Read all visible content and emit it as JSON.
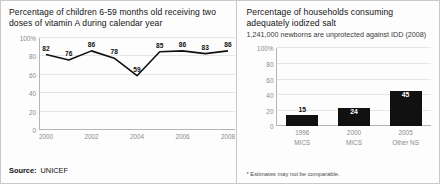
{
  "left": {
    "title": "Percentage of children 6-59 months old receiving two doses of vitamin A during calendar year",
    "source_label": "Source:",
    "source_value": "UNICEF",
    "chart_data": {
      "type": "line",
      "title": "Percentage of children 6-59 months old receiving two doses of vitamin A during calendar year",
      "xlabel": "",
      "ylabel": "",
      "ylim": [
        0,
        100
      ],
      "yticks": [
        "0",
        "20",
        "40",
        "60",
        "80",
        "100%"
      ],
      "ytick_values": [
        0,
        20,
        40,
        60,
        80,
        100
      ],
      "x": [
        2000,
        2001,
        2002,
        2003,
        2004,
        2005,
        2006,
        2007,
        2008
      ],
      "xticks": [
        "2000",
        "2002",
        "2004",
        "2006",
        "2008"
      ],
      "xtick_values": [
        2000,
        2002,
        2004,
        2006,
        2008
      ],
      "values": [
        82,
        76,
        86,
        78,
        59,
        85,
        86,
        83,
        86
      ],
      "point_labels": [
        "82",
        "76",
        "86",
        "78",
        "59",
        "85",
        "86",
        "83",
        "86"
      ],
      "grid": true,
      "legend": "none",
      "line_color": "#111111"
    }
  },
  "right": {
    "title": "Percentage of households consuming adequately iodized salt",
    "subtitle": "1,241,000 newborns are unprotected against IDD (2008)",
    "footnote": "* Estimates may not be comparable.",
    "chart_data": {
      "type": "bar",
      "title": "Percentage of households consuming adequately iodized salt",
      "subtitle": "1,241,000 newborns are unprotected against IDD (2008)",
      "xlabel": "",
      "ylabel": "",
      "ylim": [
        0,
        100
      ],
      "yticks": [
        "0",
        "20",
        "40",
        "60",
        "80",
        "100%"
      ],
      "ytick_values": [
        0,
        20,
        40,
        60,
        80,
        100
      ],
      "categories": [
        "1996",
        "2000",
        "2005"
      ],
      "category_sublabels": [
        "MICS",
        "MICS",
        "Other NS"
      ],
      "values": [
        15,
        24,
        45
      ],
      "bar_labels": [
        "15",
        "24",
        "45"
      ],
      "grid": true,
      "legend": "none",
      "bar_color": "#111111"
    }
  }
}
